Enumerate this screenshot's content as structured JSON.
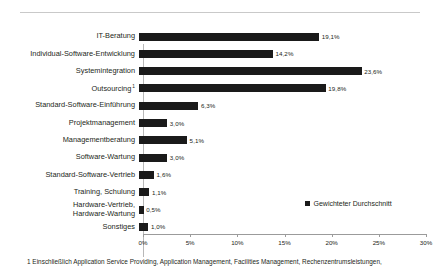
{
  "chart_data": {
    "type": "bar",
    "orientation": "horizontal",
    "title": "",
    "xlabel": "",
    "ylabel": "",
    "xlim": [
      0,
      30
    ],
    "xunit": "%",
    "grid": false,
    "legend_position": "bottom-right",
    "bar_color": "#1a1a1a",
    "categories": [
      "IT-Beratung",
      "Individual-Software-Entwicklung",
      "Systemintegration",
      "Outsourcing",
      "Standard-Software-Einführung",
      "Projektmanagement",
      "Managementberatung",
      "Software-Wartung",
      "Standard-Software-Vertrieb",
      "Training, Schulung",
      "Hardware-Vertrieb, Hardware-Wartung",
      "Sonstiges"
    ],
    "category_footnote_markers": [
      "",
      "",
      "",
      "1",
      "",
      "",
      "",
      "",
      "",
      "",
      "",
      ""
    ],
    "values": [
      19.1,
      14.2,
      23.6,
      19.8,
      6.3,
      3.0,
      5.1,
      3.0,
      1.6,
      1.1,
      0.5,
      1.0
    ],
    "value_labels": [
      "19,1%",
      "14,2%",
      "23,6%",
      "19,8%",
      "6,3%",
      "3,0%",
      "5,1%",
      "3,0%",
      "1,6%",
      "1,1%",
      "0,5%",
      "1,0%"
    ],
    "tick_values": [
      0,
      5,
      10,
      15,
      20,
      25,
      30
    ],
    "tick_labels": [
      "0%",
      "5%",
      "10%",
      "15%",
      "20%",
      "25%",
      "30%"
    ],
    "series": [
      {
        "name": "Gewichteter Durchschnitt",
        "values": [
          19.1,
          14.2,
          23.6,
          19.8,
          6.3,
          3.0,
          5.1,
          3.0,
          1.6,
          1.1,
          0.5,
          1.0
        ]
      }
    ]
  },
  "legend": {
    "label": "Gewichteter Durchschnitt"
  },
  "footnote": {
    "text": "1 Einschließlich Application Service Providing, Application Management, Facilities Management, Rechenzentrumsleistungen,"
  },
  "categories_display": [
    {
      "line1": "IT-Beratung",
      "line2": "",
      "marker": ""
    },
    {
      "line1": "Individual-Software-Entwicklung",
      "line2": "",
      "marker": ""
    },
    {
      "line1": "Systemintegration",
      "line2": "",
      "marker": ""
    },
    {
      "line1": "Outsourcing",
      "line2": "",
      "marker": "1"
    },
    {
      "line1": "Standard-Software-Einführung",
      "line2": "",
      "marker": ""
    },
    {
      "line1": "Projektmanagement",
      "line2": "",
      "marker": ""
    },
    {
      "line1": "Managementberatung",
      "line2": "",
      "marker": ""
    },
    {
      "line1": "Software-Wartung",
      "line2": "",
      "marker": ""
    },
    {
      "line1": "Standard-Software-Vertrieb",
      "line2": "",
      "marker": ""
    },
    {
      "line1": "Training, Schulung",
      "line2": "",
      "marker": ""
    },
    {
      "line1": "Hardware-Vertrieb,",
      "line2": "Hardware-Wartung",
      "marker": ""
    },
    {
      "line1": "Sonstiges",
      "line2": "",
      "marker": ""
    }
  ]
}
